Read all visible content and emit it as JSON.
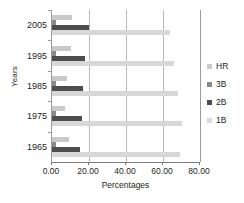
{
  "chart_data": {
    "type": "bar",
    "orientation": "horizontal",
    "title": "",
    "xlabel": "Percentages",
    "ylabel": "Years",
    "categories": [
      "2005",
      "1995",
      "1985",
      "1975",
      "1965"
    ],
    "xlim": [
      0,
      80
    ],
    "xticks": [
      "0.00",
      "20.00",
      "40.00",
      "60.00",
      "80.00"
    ],
    "xtick_values": [
      0,
      20,
      40,
      60,
      80
    ],
    "grid": true,
    "legend_position": "right",
    "series": [
      {
        "name": "HR",
        "color": "#c9c9c9",
        "values": [
          11,
          10,
          8,
          7,
          9
        ]
      },
      {
        "name": "3B",
        "color": "#8a8a8a",
        "values": [
          2,
          2,
          2,
          2,
          2
        ]
      },
      {
        "name": "2B",
        "color": "#4d4d4d",
        "values": [
          20,
          18,
          17,
          16,
          15
        ]
      },
      {
        "name": "1B",
        "color": "#d8d8d8",
        "values": [
          64,
          66,
          68,
          70,
          69
        ]
      }
    ]
  }
}
